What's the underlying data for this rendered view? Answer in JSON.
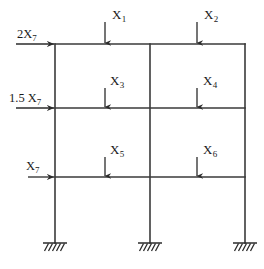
{
  "figure": {
    "name": "two-bay three-story rigid frame with applied loads",
    "type": "structural-frame-diagram",
    "line_color": "#3a3a3a",
    "text_color": "#1a1a1a",
    "background_color": "#ffffff"
  },
  "geometry": {
    "columns_x": [
      55,
      150,
      245
    ],
    "beams_y": [
      44,
      108,
      177
    ],
    "base_y": 243,
    "member_stroke_width": 1.6
  },
  "vertical_loads": [
    {
      "id": "X1",
      "label": "X",
      "subscript": "1",
      "x": 105,
      "arrow_top": 22,
      "arrow_bottom": 44,
      "label_x": 112,
      "label_y": 8
    },
    {
      "id": "X2",
      "label": "X",
      "subscript": "2",
      "x": 197,
      "arrow_top": 22,
      "arrow_bottom": 44,
      "label_x": 204,
      "label_y": 8
    },
    {
      "id": "X3",
      "label": "X",
      "subscript": "3",
      "x": 105,
      "arrow_top": 88,
      "arrow_bottom": 108,
      "label_x": 110,
      "label_y": 74
    },
    {
      "id": "X4",
      "label": "X",
      "subscript": "4",
      "x": 197,
      "arrow_top": 88,
      "arrow_bottom": 108,
      "label_x": 203,
      "label_y": 74
    },
    {
      "id": "X5",
      "label": "X",
      "subscript": "5",
      "x": 105,
      "arrow_top": 157,
      "arrow_bottom": 177,
      "label_x": 110,
      "label_y": 143
    },
    {
      "id": "X6",
      "label": "X",
      "subscript": "6",
      "x": 197,
      "arrow_top": 157,
      "arrow_bottom": 177,
      "label_x": 203,
      "label_y": 143
    }
  ],
  "lateral_loads": [
    {
      "id": "L1",
      "label": "2X",
      "subscript": "7",
      "y": 44,
      "arrow_start_x": 16,
      "arrow_end_x": 55,
      "label_x": 17,
      "label_y": 28
    },
    {
      "id": "L2",
      "label": "1.5 X",
      "subscript": "7",
      "y": 108,
      "arrow_start_x": 16,
      "arrow_end_x": 55,
      "label_x": 9,
      "label_y": 92
    },
    {
      "id": "L3",
      "label": "X",
      "subscript": "7",
      "y": 177,
      "arrow_start_x": 28,
      "arrow_end_x": 55,
      "label_x": 26,
      "label_y": 160
    }
  ],
  "supports": [
    {
      "id": "support-left",
      "x": 55,
      "y": 243,
      "type": "fixed-hatched"
    },
    {
      "id": "support-center",
      "x": 150,
      "y": 243,
      "type": "fixed-hatched"
    },
    {
      "id": "support-right",
      "x": 245,
      "y": 243,
      "type": "fixed-hatched"
    }
  ]
}
